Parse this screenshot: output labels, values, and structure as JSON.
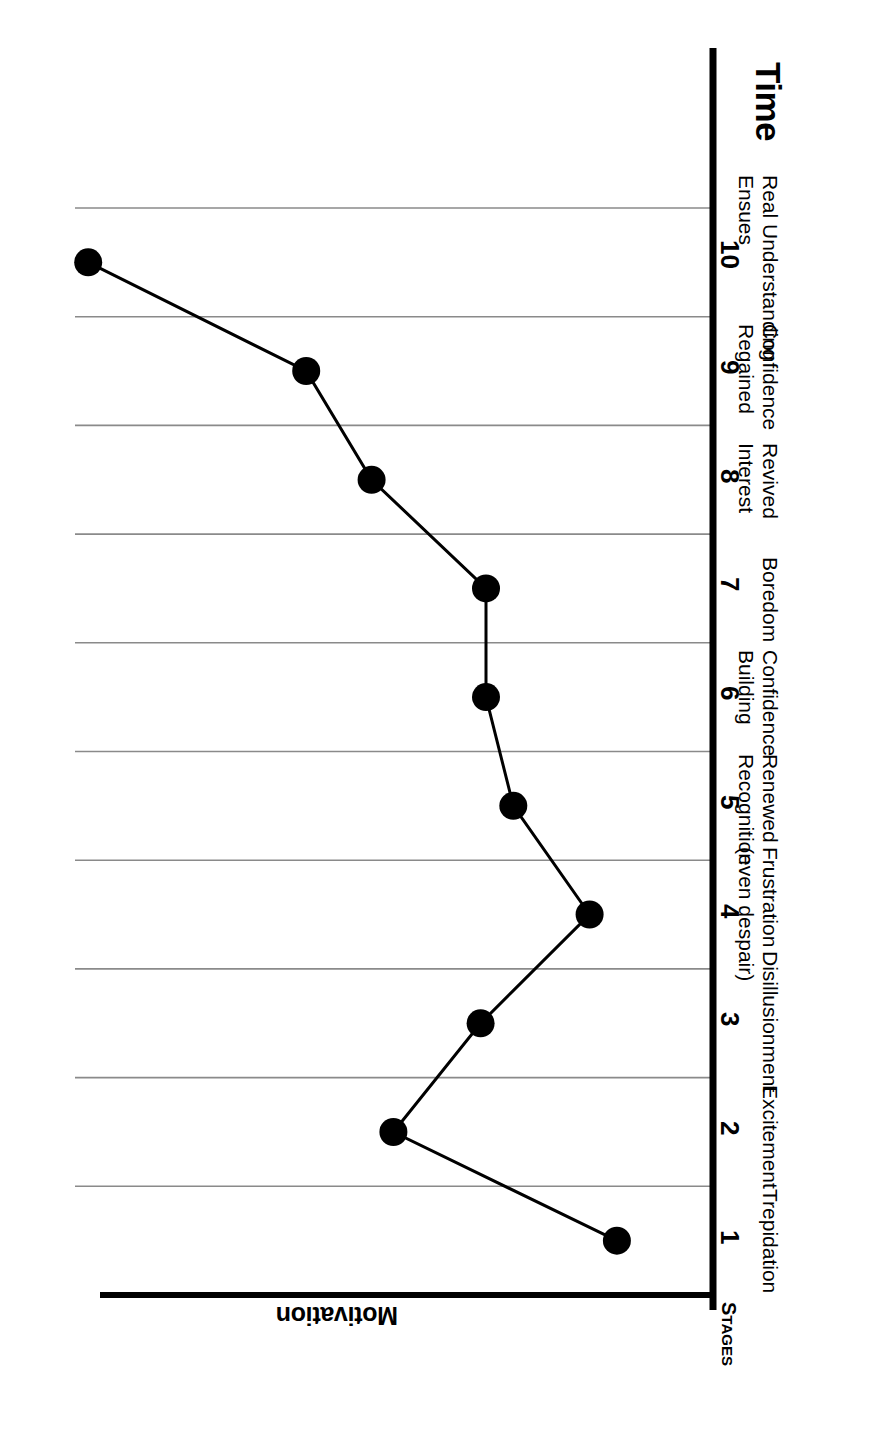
{
  "figure": {
    "axis_titles": {
      "time": "Time",
      "motivation": "Motivation",
      "stages": "Stages",
      "stages_first": "S",
      "stages_rest": "TAGES"
    },
    "colors": {
      "axis": "#000000",
      "gridline": "#8a8a8a",
      "marker": "#000000",
      "line": "#000000",
      "background": "#ffffff"
    }
  },
  "chart_data": {
    "type": "line",
    "title": "",
    "subtitle": "",
    "xlabel": "Time",
    "ylabel": "Motivation",
    "orientation": "rotated-90cw",
    "grid": true,
    "legend": "none",
    "xlim": [
      0,
      10.5
    ],
    "ylim": [
      0,
      6
    ],
    "categories": [
      "1",
      "2",
      "3",
      "4",
      "5",
      "6",
      "7",
      "8",
      "9",
      "10"
    ],
    "tick_labels": [
      "1",
      "2",
      "3",
      "4",
      "5",
      "6",
      "7",
      "8",
      "9",
      "10"
    ],
    "stage_names": [
      "Trepidation",
      "Excitement",
      "Disillusionment",
      "Frustration\n(even despair)",
      "Renewed\nRecognition",
      "Confidence\nBuilding",
      "Boredom",
      "Revived\nInterest",
      "Confidence\nRegained",
      "Real Understanding\nEnsues"
    ],
    "series": [
      {
        "name": "Motivation",
        "x": [
          1,
          2,
          3,
          4,
          5,
          6,
          7,
          8,
          9,
          10
        ],
        "values": [
          0.35,
          2.4,
          1.6,
          0.6,
          1.3,
          1.55,
          1.55,
          2.6,
          3.2,
          5.2
        ]
      }
    ],
    "annotations": []
  },
  "stages": [
    {
      "num": "1",
      "line1": "Trepidation",
      "line2": ""
    },
    {
      "num": "2",
      "line1": "Excitement",
      "line2": ""
    },
    {
      "num": "3",
      "line1": "Disillusionment",
      "line2": ""
    },
    {
      "num": "4",
      "line1": "Frustration",
      "line2": "(even despair)"
    },
    {
      "num": "5",
      "line1": "Renewed",
      "line2": "Recognition"
    },
    {
      "num": "6",
      "line1": "Confidence",
      "line2": "Building"
    },
    {
      "num": "7",
      "line1": "Boredom",
      "line2": ""
    },
    {
      "num": "8",
      "line1": "Revived",
      "line2": "Interest"
    },
    {
      "num": "9",
      "line1": "Confidence",
      "line2": "Regained"
    },
    {
      "num": "10",
      "line1": "Real Understanding",
      "line2": "Ensues"
    }
  ]
}
